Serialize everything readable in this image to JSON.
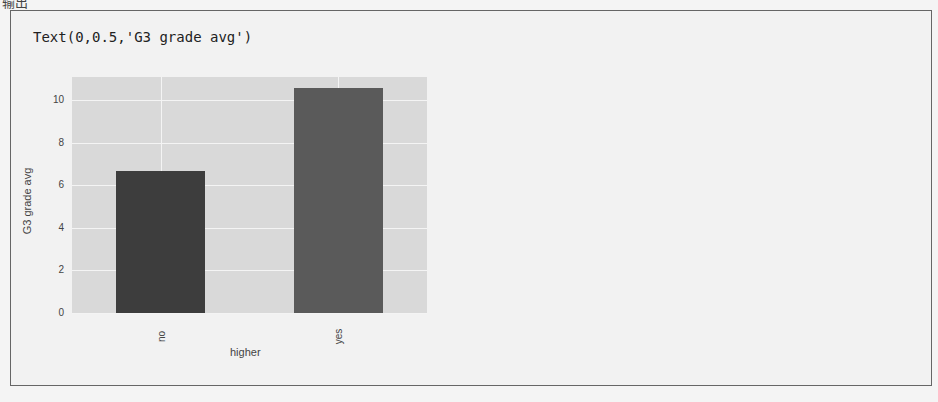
{
  "header": {
    "label": "输出"
  },
  "output": {
    "text": "Text(0,0.5,'G3 grade avg')"
  },
  "chart_data": {
    "type": "bar",
    "categories": [
      "no",
      "yes"
    ],
    "values": [
      6.7,
      10.6
    ],
    "colors": [
      "#3d3d3d",
      "#5a5a5a"
    ],
    "title": "",
    "xlabel": "higher",
    "ylabel": "G3 grade avg",
    "ylim": [
      0,
      11.1
    ],
    "yticks": [
      "0",
      "2",
      "4",
      "6",
      "8",
      "10"
    ],
    "grid": true,
    "legend": null
  }
}
